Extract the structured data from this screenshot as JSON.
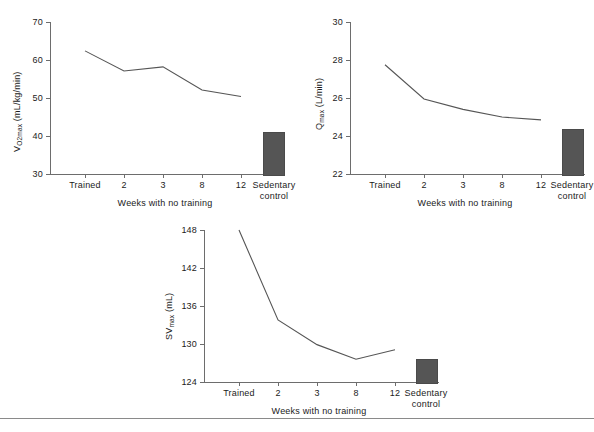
{
  "figure": {
    "background": "#ffffff",
    "line_color": "#555555",
    "bar_color": "#555555",
    "axis_color": "#6d6d6d"
  },
  "chart_data": [
    {
      "id": "vo2max",
      "type": "line",
      "title": "",
      "xlabel": "Weeks with no training",
      "ylabel": "VO2max (mL/kg/min)",
      "ylabel_main": "V",
      "ylabel_sub": "O2max",
      "ylabel_units": " (mL/kg/min)",
      "categories": [
        "Trained",
        "2",
        "3",
        "8",
        "12",
        "Sedentary control"
      ],
      "xtick_labels": [
        "Trained",
        "2",
        "3",
        "8",
        "12",
        "Sedentary"
      ],
      "xtick_label_second_line": "control",
      "ylim": [
        30,
        70
      ],
      "yticks": [
        30,
        40,
        50,
        60,
        70
      ],
      "ytick_labels": [
        "30",
        "40",
        "50",
        "60",
        "70"
      ],
      "grid": false,
      "values": [
        62.4,
        57.1,
        58.2,
        52.1,
        50.4
      ],
      "bar_category": "Sedentary control",
      "bar_value": 41.0
    },
    {
      "id": "qmax",
      "type": "line",
      "title": "",
      "xlabel": "Weeks with no training",
      "ylabel": "Qmax (L/min)",
      "ylabel_main": "Q",
      "ylabel_sub": "max",
      "ylabel_units": " (L/min)",
      "categories": [
        "Trained",
        "2",
        "3",
        "8",
        "12",
        "Sedentary control"
      ],
      "xtick_labels": [
        "Trained",
        "2",
        "3",
        "8",
        "12",
        "Sedentary"
      ],
      "xtick_label_second_line": "control",
      "ylim": [
        22,
        30
      ],
      "yticks": [
        22,
        24,
        26,
        28,
        30
      ],
      "ytick_labels": [
        "22",
        "24",
        "26",
        "28",
        "30"
      ],
      "grid": false,
      "values": [
        27.75,
        25.95,
        25.4,
        25.0,
        24.85
      ],
      "bar_category": "Sedentary control",
      "bar_value": 24.35
    },
    {
      "id": "svmax",
      "type": "line",
      "title": "",
      "xlabel": "Weeks with no training",
      "ylabel": "SVmax (mL)",
      "ylabel_main": "SV",
      "ylabel_sub": "max",
      "ylabel_units": " (mL)",
      "categories": [
        "Trained",
        "2",
        "3",
        "8",
        "12",
        "Sedentary control"
      ],
      "xtick_labels": [
        "Trained",
        "2",
        "3",
        "8",
        "12",
        "Sedentary"
      ],
      "xtick_label_second_line": "control",
      "ylim": [
        124,
        148
      ],
      "yticks": [
        124,
        130,
        136,
        142,
        148
      ],
      "ytick_labels": [
        "124",
        "130",
        "136",
        "142",
        "148"
      ],
      "grid": false,
      "values": [
        148.0,
        133.8,
        129.9,
        127.6,
        129.1
      ],
      "bar_category": "Sedentary control",
      "bar_value": 127.6
    }
  ]
}
